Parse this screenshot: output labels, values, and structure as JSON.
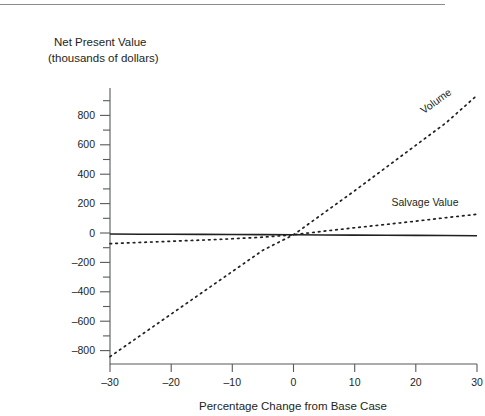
{
  "figure": {
    "top_rule": true,
    "background": "#ffffff",
    "ink_color": "#231f20",
    "axis_color": "#58595b"
  },
  "chart_data": {
    "type": "line",
    "title": "",
    "ylabel_line1": "Net Present Value",
    "ylabel_line2": "(thousands of dollars)",
    "xlabel": "Percentage Change from Base Case",
    "xlim": [
      -31,
      31
    ],
    "ylim": [
      -880,
      1000
    ],
    "grid": false,
    "legend": "inline-labels",
    "xticks": [
      -30,
      -20,
      -10,
      0,
      10,
      20,
      30
    ],
    "xtick_labels": [
      "–30",
      "–20",
      "–10",
      "0",
      "10",
      "20",
      "30"
    ],
    "yticks": [
      -800,
      -600,
      -400,
      -200,
      0,
      200,
      400,
      600,
      800
    ],
    "ytick_labels": [
      "–800",
      "–600",
      "–400",
      "–200",
      "0",
      "200",
      "400",
      "600",
      "800"
    ],
    "yminor_ticks": [
      -700,
      -500,
      -300,
      -100,
      100,
      300,
      500,
      700,
      900,
      1000
    ],
    "x": [
      -30,
      -25,
      -20,
      -15,
      -10,
      -5,
      0,
      5,
      10,
      15,
      20,
      25,
      30
    ],
    "series": [
      {
        "name": "Volume",
        "style": "dotted",
        "label_rotation": -36,
        "values": [
          -830,
          -685,
          -540,
          -395,
          -250,
          -105,
          0,
          150,
          300,
          455,
          610,
          765,
          950
        ]
      },
      {
        "name": "Salvage Value",
        "style": "dotted",
        "label_rotation": 0,
        "values": [
          -60,
          -52,
          -44,
          -36,
          -27,
          -16,
          0,
          25,
          48,
          70,
          93,
          117,
          140
        ]
      },
      {
        "name": "Fixed Costs",
        "style": "solid",
        "label_rotation": 0,
        "values": [
          5,
          4,
          4,
          3,
          2,
          1,
          0,
          -1,
          -2,
          -3,
          -4,
          -5,
          -6
        ]
      }
    ]
  }
}
